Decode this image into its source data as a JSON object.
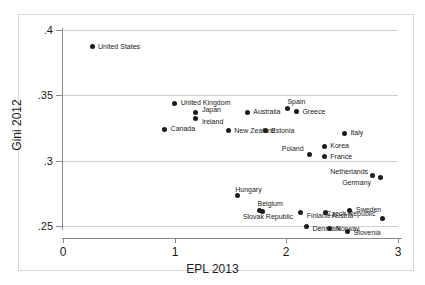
{
  "chart_data": {
    "type": "scatter",
    "title": "",
    "xlabel": "EPL 2013",
    "ylabel": "Gini 2012",
    "xlim": [
      0,
      3
    ],
    "ylim": [
      0.25,
      0.4
    ],
    "xticks": [
      "0",
      "1",
      "2",
      "3"
    ],
    "xtick_values": [
      0,
      1,
      2,
      3
    ],
    "yticks": [
      ".25",
      ".3",
      ".35",
      ".4"
    ],
    "ytick_values": [
      0.25,
      0.3,
      0.35,
      0.4
    ],
    "grid": "horizontal",
    "legend": "none",
    "points": [
      {
        "label": "United States",
        "x": 0.26,
        "y": 0.387,
        "lx": 6,
        "ly": -4
      },
      {
        "label": "United Kingdom",
        "x": 1.0,
        "y": 0.344,
        "lx": 6,
        "ly": -4
      },
      {
        "label": "Japan",
        "x": 1.19,
        "y": 0.337,
        "lx": 6,
        "ly": -6
      },
      {
        "label": "Ireland",
        "x": 1.19,
        "y": 0.332,
        "lx": 6,
        "ly": -1
      },
      {
        "label": "Canada",
        "x": 0.91,
        "y": 0.324,
        "lx": 6,
        "ly": -4
      },
      {
        "label": "Australia",
        "x": 1.65,
        "y": 0.337,
        "lx": 6,
        "ly": -4
      },
      {
        "label": "Spain",
        "x": 2.01,
        "y": 0.34,
        "lx": 0,
        "ly": -10
      },
      {
        "label": "Greece",
        "x": 2.09,
        "y": 0.338,
        "lx": 6,
        "ly": -3
      },
      {
        "label": "New Zealand",
        "x": 1.48,
        "y": 0.323,
        "lx": 6,
        "ly": -4
      },
      {
        "label": "Estonia",
        "x": 1.81,
        "y": 0.323,
        "lx": 6,
        "ly": -4
      },
      {
        "label": "Italy",
        "x": 2.52,
        "y": 0.321,
        "lx": 6,
        "ly": -4
      },
      {
        "label": "Korea",
        "x": 2.34,
        "y": 0.311,
        "lx": 6,
        "ly": -4
      },
      {
        "label": "Poland",
        "x": 2.21,
        "y": 0.305,
        "lx": -28,
        "ly": -9
      },
      {
        "label": "France",
        "x": 2.34,
        "y": 0.303,
        "lx": 6,
        "ly": -4
      },
      {
        "label": "Netherlands",
        "x": 2.77,
        "y": 0.289,
        "lx": -42,
        "ly": -7
      },
      {
        "label": "Germany",
        "x": 2.84,
        "y": 0.287,
        "lx": -38,
        "ly": 1
      },
      {
        "label": "Hungary",
        "x": 1.56,
        "y": 0.273,
        "lx": -2,
        "ly": -10
      },
      {
        "label": "Sweden",
        "x": 2.57,
        "y": 0.262,
        "lx": 6,
        "ly": -4
      },
      {
        "label": "Austria",
        "x": 2.35,
        "y": 0.26,
        "lx": 6,
        "ly": -1
      },
      {
        "label": "Belgium",
        "x": 1.76,
        "y": 0.262,
        "lx": -2,
        "ly": -10
      },
      {
        "label": "Slovak Republic",
        "x": 1.79,
        "y": 0.261,
        "lx": -20,
        "ly": 1
      },
      {
        "label": "Finland",
        "x": 2.13,
        "y": 0.26,
        "lx": 6,
        "ly": -1
      },
      {
        "label": "Czech Republic",
        "x": 2.86,
        "y": 0.256,
        "lx": -56,
        "ly": -8
      },
      {
        "label": "Denmark",
        "x": 2.18,
        "y": 0.25,
        "lx": 6,
        "ly": -1
      },
      {
        "label": "Norway",
        "x": 2.39,
        "y": 0.248,
        "lx": 6,
        "ly": -4
      },
      {
        "label": "Slovenia",
        "x": 2.55,
        "y": 0.246,
        "lx": 6,
        "ly": -2
      }
    ]
  }
}
